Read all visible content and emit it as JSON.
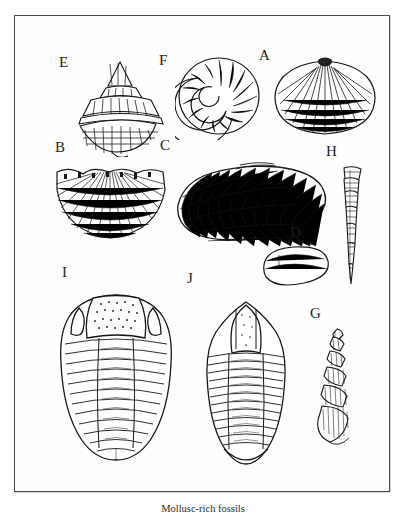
{
  "plate": {
    "caption": "Mollusc-rich fossils",
    "frame_color": "#4a4a4a",
    "background_color": "#ffffff",
    "ink_color": "#161616"
  },
  "specimens": [
    {
      "id": "A",
      "label": "A",
      "name": "ribbed-brachiopod-shell",
      "description": "Fan-shaped ribbed brachiopod / scallop valve, radiating costae with concentric growth lines"
    },
    {
      "id": "B",
      "label": "B",
      "name": "fan-brachiopod-shell",
      "description": "Broad fan-shaped brachiopod with crenulated hinge margin and radiating striae"
    },
    {
      "id": "C",
      "label": "C",
      "name": "elongate-bivalve-shell",
      "description": "Large elongate mussel-like bivalve with concentric growth bands"
    },
    {
      "id": "D",
      "label": "D",
      "name": "small-oval-shell",
      "description": "Small smooth ovate shell, stippled surface"
    },
    {
      "id": "E",
      "label": "E",
      "name": "conical-gastropod-shell",
      "description": "Conical top-shell gastropod with stepped whorls and beaded spiral cords"
    },
    {
      "id": "F",
      "label": "F",
      "name": "planispiral-coiled-shell",
      "description": "Planispiral coiled shell (ammonoid / nautiloid) with ribbed whorls"
    },
    {
      "id": "G",
      "label": "G",
      "name": "high-spired-gastropod-shell",
      "description": "High-spired turreted gastropod with many whorls"
    },
    {
      "id": "H",
      "label": "H",
      "name": "slender-conical-fossil",
      "description": "Slender tapering orthoconic shell with transverse septal rings"
    },
    {
      "id": "I",
      "label": "I",
      "name": "trilobite-large",
      "description": "Trilobite with large granulated glabella, crescentic eyes and segmented thorax"
    },
    {
      "id": "J",
      "label": "J",
      "name": "trilobite-narrow",
      "description": "Trilobite with triangular glabella and numerous narrow thoracic segments"
    }
  ]
}
